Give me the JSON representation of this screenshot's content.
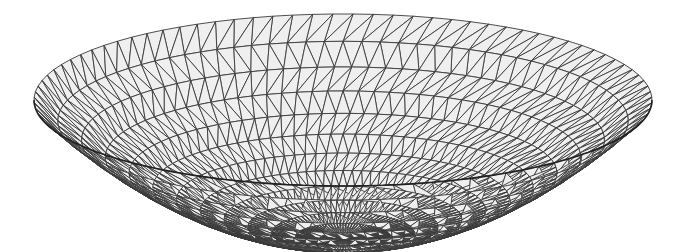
{
  "image": {
    "subject": "Triangulated wireframe mesh of a bowl-shaped paraboloid surface",
    "width": 685,
    "height": 252
  },
  "mesh": {
    "center_x": 343,
    "rim_center_y": 100,
    "rim_rx": 309,
    "rim_ry": 86,
    "depth": 140,
    "rings": 13,
    "segments": 96,
    "fill_color": "#efefef",
    "line_color": "#3a3a3a",
    "line_width": 0.9,
    "background": "#ffffff"
  }
}
